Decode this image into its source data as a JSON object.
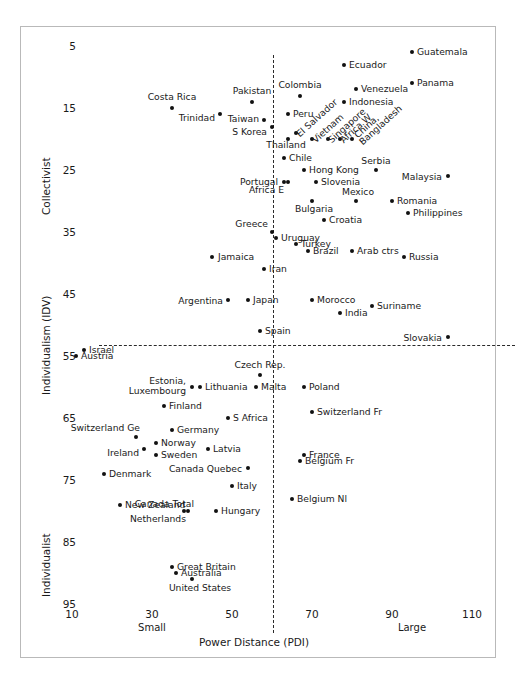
{
  "chart_data": {
    "type": "scatter",
    "title": "",
    "xlabel": "Power Distance (PDI)",
    "ylabel": "Individualism (IDV)",
    "xlim": [
      5,
      117
    ],
    "ylim": [
      2,
      98
    ],
    "y_inverted": true,
    "grid": false,
    "legend": null,
    "xticks": [
      10,
      30,
      50,
      70,
      90,
      110
    ],
    "yticks": [
      5,
      15,
      25,
      35,
      45,
      55,
      65,
      75,
      85,
      95
    ],
    "x_axis_low_label": "Small",
    "x_axis_high_label": "Large",
    "y_axis_low_label": "Collectivist",
    "y_axis_high_label": "Individualist",
    "reference_lines": {
      "vertical_x": 50,
      "horizontal_y": 50,
      "style": "dash-dot"
    },
    "points": [
      {
        "label": "Guatemala",
        "x": 95,
        "y": 6,
        "pos": "right"
      },
      {
        "label": "Ecuador",
        "x": 78,
        "y": 8,
        "pos": "right"
      },
      {
        "label": "Panama",
        "x": 95,
        "y": 11,
        "pos": "right"
      },
      {
        "label": "Venezuela",
        "x": 81,
        "y": 12,
        "pos": "right"
      },
      {
        "label": "Colombia",
        "x": 67,
        "y": 13,
        "pos": "above"
      },
      {
        "label": "Costa Rica",
        "x": 35,
        "y": 15,
        "pos": "above"
      },
      {
        "label": "Pakistan",
        "x": 55,
        "y": 14,
        "pos": "above"
      },
      {
        "label": "Indonesia",
        "x": 78,
        "y": 14,
        "pos": "right"
      },
      {
        "label": "Trinidad",
        "x": 47,
        "y": 16,
        "pos": "left"
      },
      {
        "label": "Taiwan",
        "x": 58,
        "y": 17,
        "pos": "left"
      },
      {
        "label": "Peru",
        "x": 64,
        "y": 16,
        "pos": "right"
      },
      {
        "label": "El Salvador",
        "x": 66,
        "y": 19,
        "pos": "diag"
      },
      {
        "label": "Vietnam",
        "x": 70,
        "y": 20,
        "pos": "diag"
      },
      {
        "label": "Singapore",
        "x": 74,
        "y": 20,
        "pos": "diag"
      },
      {
        "label": "Africa W",
        "x": 77,
        "y": 20,
        "pos": "diag"
      },
      {
        "label": "China,",
        "x": 80,
        "y": 20,
        "pos": "diag"
      },
      {
        "label": "Bangladesh",
        "x": 80,
        "y": 20,
        "pos": "diag"
      },
      {
        "label": "S Korea",
        "x": 60,
        "y": 18,
        "pos": "left"
      },
      {
        "label": "Thailand",
        "x": 64,
        "y": 20,
        "pos": "above"
      },
      {
        "label": "Chile",
        "x": 63,
        "y": 23,
        "pos": "right"
      },
      {
        "label": "Serbia",
        "x": 86,
        "y": 25,
        "pos": "above"
      },
      {
        "label": "Hong Kong",
        "x": 68,
        "y": 25,
        "pos": "right"
      },
      {
        "label": "Malaysia",
        "x": 104,
        "y": 26,
        "pos": "left"
      },
      {
        "label": "Portugal",
        "x": 63,
        "y": 27,
        "pos": "left"
      },
      {
        "label": "Africa E",
        "x": 64,
        "y": 27,
        "pos": "below"
      },
      {
        "label": "Slovenia",
        "x": 71,
        "y": 27,
        "pos": "right"
      },
      {
        "label": "Mexico",
        "x": 81,
        "y": 30,
        "pos": "above"
      },
      {
        "label": "Romania",
        "x": 90,
        "y": 30,
        "pos": "right"
      },
      {
        "label": "Bulgaria",
        "x": 70,
        "y": 30,
        "pos": "below"
      },
      {
        "label": "Philippines",
        "x": 94,
        "y": 32,
        "pos": "right"
      },
      {
        "label": "Greece",
        "x": 60,
        "y": 35,
        "pos": "above"
      },
      {
        "label": "Croatia",
        "x": 73,
        "y": 33,
        "pos": "right"
      },
      {
        "label": "Uruguay",
        "x": 61,
        "y": 36,
        "pos": "right"
      },
      {
        "label": "Turkey",
        "x": 66,
        "y": 37,
        "pos": "right"
      },
      {
        "label": "Arab ctrs",
        "x": 80,
        "y": 38,
        "pos": "right"
      },
      {
        "label": "Brazil",
        "x": 69,
        "y": 38,
        "pos": "right"
      },
      {
        "label": "Russia",
        "x": 93,
        "y": 39,
        "pos": "right"
      },
      {
        "label": "Jamaica",
        "x": 45,
        "y": 39,
        "pos": "right"
      },
      {
        "label": "Iran",
        "x": 58,
        "y": 41,
        "pos": "right"
      },
      {
        "label": "Argentina",
        "x": 49,
        "y": 46,
        "pos": "left"
      },
      {
        "label": "Japan",
        "x": 54,
        "y": 46,
        "pos": "right"
      },
      {
        "label": "Morocco",
        "x": 70,
        "y": 46,
        "pos": "right"
      },
      {
        "label": "Suriname",
        "x": 85,
        "y": 47,
        "pos": "right"
      },
      {
        "label": "India",
        "x": 77,
        "y": 48,
        "pos": "right"
      },
      {
        "label": "Spain",
        "x": 57,
        "y": 51,
        "pos": "right"
      },
      {
        "label": "Slovakia",
        "x": 104,
        "y": 52,
        "pos": "left"
      },
      {
        "label": "Israel",
        "x": 13,
        "y": 54,
        "pos": "right"
      },
      {
        "label": "Austria",
        "x": 11,
        "y": 55,
        "pos": "right"
      },
      {
        "label": "Czech Rep.",
        "x": 57,
        "y": 58,
        "pos": "above"
      },
      {
        "label": "Malta",
        "x": 56,
        "y": 60,
        "pos": "right"
      },
      {
        "label": "Estonia,",
        "x": 40,
        "y": 60,
        "pos": "left"
      },
      {
        "label": "Luxembourg",
        "x": 40,
        "y": 60,
        "pos": "left"
      },
      {
        "label": "Lithuania",
        "x": 42,
        "y": 60,
        "pos": "right"
      },
      {
        "label": "Poland",
        "x": 68,
        "y": 60,
        "pos": "right"
      },
      {
        "label": "Finland",
        "x": 33,
        "y": 63,
        "pos": "right"
      },
      {
        "label": "Switzerland Fr",
        "x": 70,
        "y": 64,
        "pos": "right"
      },
      {
        "label": "S Africa",
        "x": 49,
        "y": 65,
        "pos": "right"
      },
      {
        "label": "Germany",
        "x": 35,
        "y": 67,
        "pos": "right"
      },
      {
        "label": "Switzerland Ge",
        "x": 26,
        "y": 68,
        "pos": "above"
      },
      {
        "label": "Norway",
        "x": 31,
        "y": 69,
        "pos": "right"
      },
      {
        "label": "Latvia",
        "x": 44,
        "y": 70,
        "pos": "right"
      },
      {
        "label": "Ireland",
        "x": 28,
        "y": 70,
        "pos": "left"
      },
      {
        "label": "Sweden",
        "x": 31,
        "y": 71,
        "pos": "right"
      },
      {
        "label": "France",
        "x": 68,
        "y": 71,
        "pos": "right"
      },
      {
        "label": "Belgium Fr",
        "x": 67,
        "y": 72,
        "pos": "right"
      },
      {
        "label": "Canada Quebec",
        "x": 54,
        "y": 73,
        "pos": "left"
      },
      {
        "label": "Denmark",
        "x": 18,
        "y": 74,
        "pos": "right"
      },
      {
        "label": "Italy",
        "x": 50,
        "y": 76,
        "pos": "right"
      },
      {
        "label": "Belgium Nl",
        "x": 65,
        "y": 78,
        "pos": "right"
      },
      {
        "label": "New Zealand",
        "x": 22,
        "y": 79,
        "pos": "right"
      },
      {
        "label": "Canada Total",
        "x": 39,
        "y": 80,
        "pos": "above"
      },
      {
        "label": "Netherlands",
        "x": 38,
        "y": 80,
        "pos": "below"
      },
      {
        "label": "Hungary",
        "x": 46,
        "y": 80,
        "pos": "right"
      },
      {
        "label": "Great Britain",
        "x": 35,
        "y": 89,
        "pos": "right"
      },
      {
        "label": "Australia",
        "x": 36,
        "y": 90,
        "pos": "right"
      },
      {
        "label": "United States",
        "x": 40,
        "y": 91,
        "pos": "below"
      }
    ]
  }
}
